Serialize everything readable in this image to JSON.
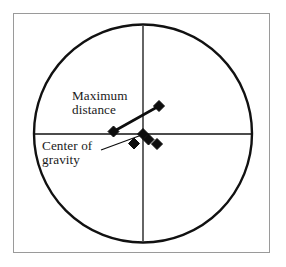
{
  "figure": {
    "background_color": "#ffffff",
    "frame": {
      "name": "outer-border",
      "x": 13,
      "y": 13,
      "width": 257,
      "height": 240,
      "stroke_color": "#9a9a9a",
      "stroke_width": 1
    }
  },
  "labels": {
    "maximum_distance": {
      "line1": "Maximum",
      "line2": "distance"
    },
    "center_of_gravity": {
      "line1": "Center of",
      "line2": "gravity"
    }
  },
  "chart_data": {
    "type": "scatter",
    "title": "",
    "subtitle": "",
    "xlabel": "",
    "ylabel": "",
    "grid": false,
    "legend": null,
    "axis_style": "crosshair-through-circle-center",
    "xlim": [
      -1.1,
      1.1
    ],
    "ylim": [
      -1.1,
      1.1
    ],
    "circle": {
      "name": "target-circle",
      "cx": 143,
      "cy": 133.5,
      "r": 109,
      "stroke_color": "#111111",
      "stroke_width": 2.4,
      "fill": "none"
    },
    "axes": {
      "horizontal": {
        "x1": 34,
        "y1": 134,
        "x2": 252,
        "y2": 134,
        "stroke_color": "#111111",
        "stroke_width": 1.3
      },
      "vertical": {
        "x1": 143,
        "y1": 26,
        "x2": 143,
        "y2": 241,
        "stroke_color": "#111111",
        "stroke_width": 1.3
      }
    },
    "marker": {
      "shape": "diamond",
      "color": "#0d0d0d",
      "size_px": 11
    },
    "points": [
      {
        "id": "p1",
        "label": "outlier-upper-right",
        "px": 159,
        "py": 106,
        "x": 0.147,
        "y": 0.252
      },
      {
        "id": "p2",
        "label": "outlier-left",
        "px": 113.5,
        "py": 131.5,
        "x": -0.271,
        "y": 0.018
      },
      {
        "id": "p3",
        "label": "center-of-gravity",
        "px": 143,
        "py": 134,
        "x": 0.0,
        "y": -0.005
      },
      {
        "id": "p4",
        "label": "cluster-right",
        "px": 148.5,
        "py": 139.5,
        "x": 0.05,
        "y": -0.055
      },
      {
        "id": "p5",
        "label": "cluster-lower-left",
        "px": 134,
        "py": 143.5,
        "x": -0.083,
        "y": -0.092
      },
      {
        "id": "p6",
        "label": "cluster-lower-right",
        "px": 157,
        "py": 144,
        "x": 0.128,
        "y": -0.096
      }
    ],
    "annotations": [
      {
        "name": "maximum-distance-connector",
        "kind": "segment",
        "text": "Maximum distance",
        "from_point": "p2",
        "to_point": "p1",
        "x1": 113.5,
        "y1": 131.5,
        "x2": 159,
        "y2": 106,
        "stroke_color": "#0d0d0d",
        "stroke_width": 2.6
      },
      {
        "name": "center-of-gravity-leader",
        "kind": "leader",
        "text": "Center of gravity",
        "to_point": "p3",
        "x1": 101,
        "y1": 150,
        "x2": 143,
        "y2": 134.5,
        "stroke_color": "#0d0d0d",
        "stroke_width": 1.2
      }
    ]
  }
}
